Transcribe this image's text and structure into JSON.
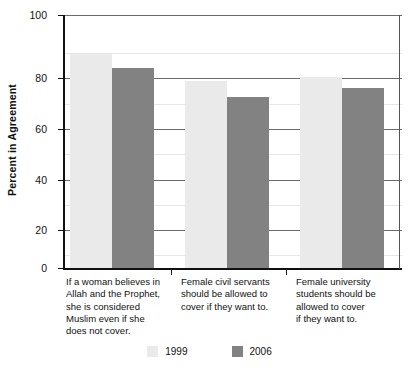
{
  "chart_data": {
    "type": "bar",
    "title": "",
    "xlabel": "",
    "ylabel": "Percent in Agreement",
    "ylim": [
      0,
      100
    ],
    "ytick_labels": [
      "0",
      "20",
      "40",
      "60",
      "80",
      "100"
    ],
    "ytick_values": [
      0,
      20,
      40,
      60,
      80,
      100
    ],
    "minor_tick_values": [
      10,
      30,
      50,
      70,
      90
    ],
    "grid": true,
    "legend_position": "bottom-center",
    "categories": [
      "If a woman believes in Allah and the Prophet, she is considered Muslim even if she does not cover.",
      "Female civil servants should be allowed to cover if they want to.",
      "Female university students should be allowed to cover if they want to."
    ],
    "category_lines": [
      [
        "If a woman believes in",
        "Allah and the Prophet,",
        "she is considered",
        "Muslim even if she",
        "does not cover."
      ],
      [
        "Female civil servants",
        "should be allowed to",
        "cover if they want to."
      ],
      [
        "Female university",
        "students should be",
        "allowed to cover",
        "if they want to."
      ]
    ],
    "series": [
      {
        "name": "1999",
        "color": "#eaeaea",
        "values": [
          84.5,
          74,
          75.5
        ]
      },
      {
        "name": "2006",
        "color": "#828282",
        "values": [
          79,
          67.5,
          71
        ]
      }
    ]
  },
  "legend": {
    "items": [
      {
        "label": "1999",
        "color": "#eaeaea"
      },
      {
        "label": "2006",
        "color": "#828282"
      }
    ]
  },
  "axes": {
    "y_title": "Percent in Agreement",
    "y_labels": {
      "t0": "0",
      "t20": "20",
      "t40": "40",
      "t60": "60",
      "t80": "80",
      "t100": "100"
    }
  },
  "labels": {
    "cat0": {
      "l0": "If a woman believes in",
      "l1": "Allah and the Prophet,",
      "l2": "she is considered",
      "l3": "Muslim even if she",
      "l4": "does not cover."
    },
    "cat1": {
      "l0": "Female civil servants",
      "l1": "should be allowed to",
      "l2": "cover if they want to."
    },
    "cat2": {
      "l0": "Female university",
      "l1": "students should be",
      "l2": "allowed to cover",
      "l3": "if they want to."
    }
  }
}
